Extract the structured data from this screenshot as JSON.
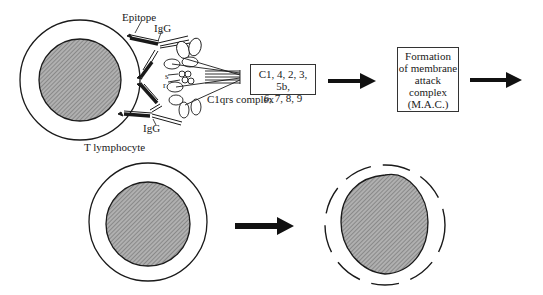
{
  "diagram": {
    "labels": {
      "epitope": "Epitope",
      "igg_top": "IgG",
      "igg_bottom": "IgG",
      "s": "s",
      "r": "r",
      "c1qrs": "C1qrs complex",
      "cell": "T lymphocyte"
    },
    "cascade_box": {
      "line1": "C1, 4, 2, 3, 5b,",
      "line2": "6, 7, 8, 9"
    },
    "mac_box": {
      "line1": "Formation",
      "line2": "of membrane",
      "line3": "attack",
      "line4": "complex",
      "line5": "(M.A.C.)"
    },
    "colors": {
      "stroke": "#1a1a1a",
      "nucleus_fill": "#9a9a9a",
      "background": "#ffffff"
    }
  }
}
